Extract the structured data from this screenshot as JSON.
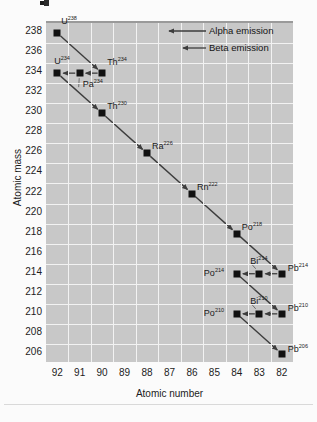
{
  "chart_data": {
    "type": "scatter",
    "title": "",
    "xlabel": "Atomic number",
    "ylabel": "Atomic mass",
    "xticks": [
      92,
      91,
      90,
      89,
      88,
      87,
      86,
      85,
      84,
      83,
      82
    ],
    "yticks": [
      238,
      236,
      234,
      232,
      230,
      228,
      226,
      224,
      222,
      220,
      218,
      216,
      214,
      212,
      210,
      208,
      206
    ],
    "xlim": [
      92.5,
      81.5
    ],
    "ylim": [
      205,
      239
    ],
    "grid": true,
    "legend_position": "top-right",
    "legend": [
      {
        "label": "Alpha emission",
        "arrow": "long"
      },
      {
        "label": "Beta emission",
        "arrow": "short"
      }
    ],
    "nodes": [
      {
        "symbol": "U",
        "mass": "238",
        "z": 92,
        "a": 238,
        "label_dx": 4,
        "label_dy": -12
      },
      {
        "symbol": "U",
        "mass": "234",
        "z": 92,
        "a": 234,
        "label_dx": -3,
        "label_dy": -12
      },
      {
        "symbol": "Pa",
        "mass": "234",
        "z": 91,
        "a": 234,
        "label_dx": 3,
        "label_dy": 11
      },
      {
        "symbol": "Th",
        "mass": "234",
        "z": 90,
        "a": 234,
        "label_dx": 5,
        "label_dy": -11
      },
      {
        "symbol": "Th",
        "mass": "230",
        "z": 90,
        "a": 230,
        "label_dx": 5,
        "label_dy": -7
      },
      {
        "symbol": "Ra",
        "mass": "226",
        "z": 88,
        "a": 226,
        "label_dx": 5,
        "label_dy": -7
      },
      {
        "symbol": "Rn",
        "mass": "222",
        "z": 86,
        "a": 222,
        "label_dx": 5,
        "label_dy": -7
      },
      {
        "symbol": "Po",
        "mass": "218",
        "z": 84,
        "a": 218,
        "label_dx": 5,
        "label_dy": -7
      },
      {
        "symbol": "Po",
        "mass": "214",
        "z": 84,
        "a": 214,
        "label_dx": -33,
        "label_dy": -1
      },
      {
        "symbol": "Bi",
        "mass": "214",
        "z": 83,
        "a": 214,
        "label_dx": -9,
        "label_dy": -13
      },
      {
        "symbol": "Pb",
        "mass": "214",
        "z": 82,
        "a": 214,
        "label_dx": 6,
        "label_dy": -6
      },
      {
        "symbol": "Po",
        "mass": "210",
        "z": 84,
        "a": 210,
        "label_dx": -33,
        "label_dy": -1
      },
      {
        "symbol": "Bi",
        "mass": "210",
        "z": 83,
        "a": 210,
        "label_dx": -9,
        "label_dy": -13
      },
      {
        "symbol": "Pb",
        "mass": "210",
        "z": 82,
        "a": 210,
        "label_dx": 6,
        "label_dy": -6
      },
      {
        "symbol": "Pb",
        "mass": "206",
        "z": 82,
        "a": 206,
        "label_dx": 6,
        "label_dy": -5
      }
    ],
    "decays": [
      {
        "from": {
          "z": 92,
          "a": 238
        },
        "to": {
          "z": 90,
          "a": 234
        },
        "type": "alpha"
      },
      {
        "from": {
          "z": 90,
          "a": 234
        },
        "to": {
          "z": 91,
          "a": 234
        },
        "type": "beta"
      },
      {
        "from": {
          "z": 91,
          "a": 234
        },
        "to": {
          "z": 92,
          "a": 234
        },
        "type": "beta"
      },
      {
        "from": {
          "z": 92,
          "a": 234
        },
        "to": {
          "z": 90,
          "a": 230
        },
        "type": "alpha"
      },
      {
        "from": {
          "z": 90,
          "a": 230
        },
        "to": {
          "z": 88,
          "a": 226
        },
        "type": "alpha"
      },
      {
        "from": {
          "z": 88,
          "a": 226
        },
        "to": {
          "z": 86,
          "a": 222
        },
        "type": "alpha"
      },
      {
        "from": {
          "z": 86,
          "a": 222
        },
        "to": {
          "z": 84,
          "a": 218
        },
        "type": "alpha"
      },
      {
        "from": {
          "z": 84,
          "a": 218
        },
        "to": {
          "z": 82,
          "a": 214
        },
        "type": "alpha"
      },
      {
        "from": {
          "z": 82,
          "a": 214
        },
        "to": {
          "z": 83,
          "a": 214
        },
        "type": "beta"
      },
      {
        "from": {
          "z": 83,
          "a": 214
        },
        "to": {
          "z": 84,
          "a": 214
        },
        "type": "beta"
      },
      {
        "from": {
          "z": 84,
          "a": 214
        },
        "to": {
          "z": 82,
          "a": 210
        },
        "type": "alpha"
      },
      {
        "from": {
          "z": 82,
          "a": 210
        },
        "to": {
          "z": 83,
          "a": 210
        },
        "type": "beta"
      },
      {
        "from": {
          "z": 83,
          "a": 210
        },
        "to": {
          "z": 84,
          "a": 210
        },
        "type": "beta"
      },
      {
        "from": {
          "z": 84,
          "a": 210
        },
        "to": {
          "z": 82,
          "a": 206
        },
        "type": "alpha"
      }
    ]
  },
  "colors": {
    "plot_background": "#c8c8c8",
    "grid": "#f2f2f2",
    "marker": "#111111",
    "arrow": "#3d3d3d",
    "text": "#1c1c1c",
    "page_background": "#fbfbfb"
  }
}
